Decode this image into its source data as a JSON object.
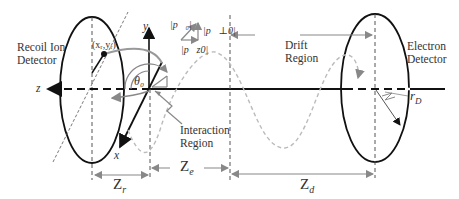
{
  "diagram": {
    "labels": {
      "recoil_ion_detector_line1": "Recoil Ion",
      "recoil_ion_detector_line2": "Detector",
      "electron_detector_line1": "Electron",
      "electron_detector_line2": "Detector",
      "drift_region_line1": "Drift",
      "drift_region_line2": "Region",
      "interaction_region_line1": "Interaction",
      "interaction_region_line2": "Region",
      "hit_position": "(xᵣ,yᵣ)",
      "axis_x": "x",
      "axis_y": "y",
      "axis_z": "z",
      "theta": "θ₀",
      "p0": "|p⃗₀|",
      "p_perp0": "|p⃗⊥0|",
      "p_z0": "|p⃗z0|",
      "r_d": "r",
      "r_d_sub": "D"
    },
    "dimensions": {
      "zr": "Z",
      "zr_sub": "r",
      "ze": "Z",
      "ze_sub": "e",
      "zd": "Z",
      "zd_sub": "d"
    },
    "colors": {
      "line": "#111111",
      "gray": "#888888",
      "lightgray": "#bbbbbb"
    }
  }
}
